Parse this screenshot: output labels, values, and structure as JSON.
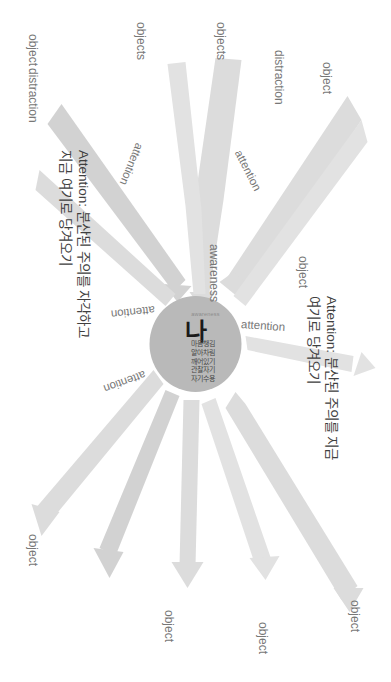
{
  "diagram": {
    "center": {
      "self_label": "나",
      "awareness_small": "awareness",
      "terms": [
        "마음챙김",
        "알아차림",
        "깨어있기",
        "관찰자기",
        "자기수용"
      ]
    },
    "awareness_label": "awareness",
    "attention_labels": [
      "attention",
      "attention",
      "attention",
      "attention",
      "attention"
    ],
    "object_labels": [
      "object",
      "object",
      "object",
      "object",
      "object",
      "object",
      "objects",
      "objects"
    ],
    "distraction_labels": [
      "distraction",
      "distraction"
    ],
    "annotations": [
      {
        "prefix": "Attention:",
        "line1": "Attention: 분산된 주의를 지금",
        "line2": "여기로 당겨오기"
      },
      {
        "prefix": "Attention:",
        "line1": "Attention: 분산된 주의를 자각하고",
        "line2": "지금 여기로 당겨오기"
      }
    ],
    "colors": {
      "center_fill": "#b9b9b9",
      "arrow_fill": "#dcdcdc",
      "text": "#777777",
      "background": "#ffffff"
    }
  }
}
